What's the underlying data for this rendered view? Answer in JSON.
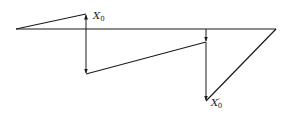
{
  "diagram": {
    "labels": {
      "x0": {
        "main": "X",
        "sub": "0"
      },
      "x0_prime": {
        "main": "X",
        "prime": "′",
        "sub": "0"
      }
    },
    "colors": {
      "line": "#1a1a1a",
      "background": "#ffffff"
    }
  }
}
